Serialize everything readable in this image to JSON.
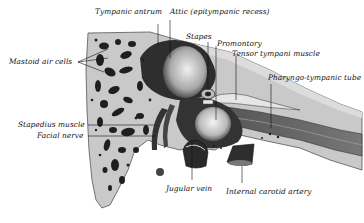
{
  "figure": {
    "type": "anatomical-illustration",
    "colors": {
      "background": "#ffffff",
      "bone": "#c9c9c9",
      "cavity": "#3a3a3a",
      "ink": "#111111"
    }
  },
  "labels": {
    "tympanic_antrum": "Tympanic antrum",
    "attic": "Attic (epitympanic recess)",
    "mastoid_air_cells": "Mastoid air cells",
    "stapes": "Stapes",
    "promontory": "Promontory",
    "tensor_tympani": "Tensor tympani muscle",
    "pharyngo_tympanic_tube": "Pharyngo-tympanic tube",
    "stapedius_muscle": "Stapedius muscle",
    "facial_nerve": "Facial nerve",
    "jugular_vein": "Jugular vein",
    "internal_carotid": "Internal carotid artery"
  }
}
